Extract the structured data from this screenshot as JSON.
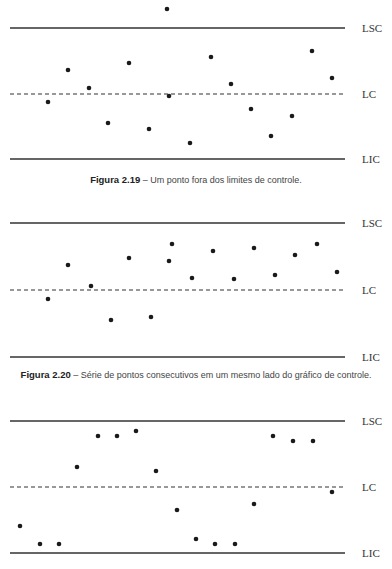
{
  "chart_data": [
    {
      "type": "scatter",
      "title": "Figura 2.19 – Um ponto fora dos limites de controle.",
      "figure_number": "Figura 2.19",
      "caption": "– Um ponto fora dos limites de controle.",
      "limits": {
        "LSC": "LSC",
        "LC": "LC",
        "LIC": "LIC"
      },
      "grid": false,
      "x": [
        1,
        2,
        3,
        4,
        5,
        6,
        7,
        8,
        9,
        10,
        11,
        12,
        13,
        14,
        15,
        16
      ],
      "values": [
        -0.13,
        0.37,
        0.09,
        -0.45,
        0.48,
        -0.54,
        1.33,
        -0.03,
        -0.75,
        0.57,
        0.15,
        -0.23,
        -0.65,
        -0.34,
        0.66,
        0.25
      ],
      "note": "values normalized: LC=0, LSC=+1, LIC=-1; point 7 lies above LSC"
    },
    {
      "type": "scatter",
      "title": "Figura 2.20 – Série de pontos consecutivos em um mesmo lado do gráfico de controle.",
      "figure_number": "Figura 2.20",
      "caption": "– Série de pontos consecutivos em um mesmo lado do gráfico de controle.",
      "limits": {
        "LSC": "LSC",
        "LC": "LC",
        "LIC": "LIC"
      },
      "grid": false,
      "x": [
        1,
        2,
        3,
        4,
        5,
        6,
        7,
        8,
        9,
        10,
        11,
        12,
        13,
        14,
        15,
        16
      ],
      "values": [
        -0.13,
        0.37,
        0.06,
        -0.45,
        0.48,
        -0.4,
        0.43,
        0.69,
        0.18,
        0.58,
        0.16,
        0.63,
        0.22,
        0.52,
        0.69,
        0.27
      ],
      "note": "values normalized: LC=0, LSC=+1, LIC=-1"
    },
    {
      "type": "scatter",
      "title": "Figura 2.21 (caption cut off)",
      "figure_number": "Figura 2.21",
      "caption": "",
      "limits": {
        "LSC": "LSC",
        "LC": "LC",
        "LIC": "LIC"
      },
      "grid": false,
      "x": [
        1,
        2,
        3,
        4,
        5,
        6,
        7,
        8,
        9,
        10,
        11,
        12,
        13,
        14,
        15,
        16,
        17
      ],
      "values": [
        -0.59,
        -0.86,
        -0.86,
        0.3,
        0.77,
        0.77,
        0.85,
        0.24,
        -0.35,
        -0.79,
        -0.86,
        -0.86,
        -0.26,
        0.77,
        0.7,
        0.7,
        -0.08
      ],
      "note": "values normalized: LC=0, LSC=+1, LIC=-1"
    }
  ],
  "charts": [
    {
      "lines": {
        "LSC": 28,
        "LC": 94,
        "LIC": 159
      },
      "labels": {
        "LSC": "LSC",
        "LC": "LC",
        "LIC": "LIC"
      },
      "caption_bold": "Figura 2.19",
      "caption_text": " – Um ponto fora dos limites de controle.",
      "caption_y": 183,
      "caption_x": 196,
      "points": [
        [
          48,
          102
        ],
        [
          68,
          70
        ],
        [
          89,
          88
        ],
        [
          108,
          123
        ],
        [
          129,
          63
        ],
        [
          149,
          129
        ],
        [
          167,
          9
        ],
        [
          169,
          96
        ],
        [
          190,
          143
        ],
        [
          211,
          57
        ],
        [
          231,
          84
        ],
        [
          251,
          109
        ],
        [
          271,
          136
        ],
        [
          292,
          116
        ],
        [
          312,
          51
        ],
        [
          332,
          78
        ]
      ]
    },
    {
      "lines": {
        "LSC": 223,
        "LC": 290,
        "LIC": 357
      },
      "labels": {
        "LSC": "LSC",
        "LC": "LC",
        "LIC": "LIC"
      },
      "caption_bold": "Figura 2.20",
      "caption_text": " – Série de pontos consecutivos em um mesmo lado do gráfico de controle.",
      "caption_y": 378,
      "caption_x": 196,
      "points": [
        [
          48,
          299
        ],
        [
          68,
          265
        ],
        [
          91,
          286
        ],
        [
          111,
          320
        ],
        [
          129,
          258
        ],
        [
          151,
          317
        ],
        [
          169,
          261
        ],
        [
          172,
          244
        ],
        [
          192,
          278
        ],
        [
          213,
          251
        ],
        [
          234,
          279
        ],
        [
          254,
          248
        ],
        [
          275,
          275
        ],
        [
          295,
          255
        ],
        [
          317,
          244
        ],
        [
          337,
          272
        ]
      ]
    },
    {
      "lines": {
        "LSC": 421,
        "LC": 487,
        "LIC": 553
      },
      "labels": {
        "LSC": "LSC",
        "LC": "LC",
        "LIC": "LIC"
      },
      "caption_bold": "",
      "caption_text": "",
      "caption_y": 573,
      "caption_x": 196,
      "points": [
        [
          20,
          526
        ],
        [
          40,
          544
        ],
        [
          59,
          544
        ],
        [
          77,
          467
        ],
        [
          98,
          436
        ],
        [
          117,
          436
        ],
        [
          136,
          431
        ],
        [
          156,
          471
        ],
        [
          177,
          510
        ],
        [
          196,
          539
        ],
        [
          215,
          544
        ],
        [
          235,
          544
        ],
        [
          254,
          504
        ],
        [
          273,
          436
        ],
        [
          293,
          441
        ],
        [
          313,
          441
        ],
        [
          332,
          492
        ]
      ]
    }
  ],
  "style": {
    "line_color": "#333333",
    "point_color": "#1a1a1a"
  }
}
